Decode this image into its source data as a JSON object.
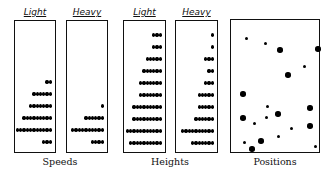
{
  "groups": [
    {
      "label": "Speeds",
      "panels": [
        {
          "title": "Light",
          "rows": [
            2,
            6,
            7,
            9,
            11,
            3
          ]
        },
        {
          "title": "Heavy",
          "rows": [
            0,
            0,
            1,
            6,
            10,
            4
          ]
        }
      ]
    },
    {
      "label": "Heights",
      "panels": [
        {
          "title": "Light",
          "rows": [
            3,
            3,
            5,
            6,
            7,
            7,
            9,
            9,
            11,
            10
          ]
        },
        {
          "title": "Heavy",
          "rows": [
            1,
            1,
            3,
            2,
            3,
            5,
            5,
            6,
            10,
            7
          ]
        }
      ]
    },
    {
      "label": "Positions"
    }
  ],
  "positions": {
    "particles": [
      {
        "x": 15,
        "y": 18,
        "size": "small"
      },
      {
        "x": 34,
        "y": 23,
        "size": "small"
      },
      {
        "x": 49,
        "y": 30,
        "size": "large"
      },
      {
        "x": 87,
        "y": 29,
        "size": "large"
      },
      {
        "x": 73,
        "y": 46,
        "size": "small"
      },
      {
        "x": 57,
        "y": 55,
        "size": "large"
      },
      {
        "x": 12,
        "y": 74,
        "size": "large"
      },
      {
        "x": 36,
        "y": 86,
        "size": "small"
      },
      {
        "x": 79,
        "y": 88,
        "size": "large"
      },
      {
        "x": 47,
        "y": 94,
        "size": "large"
      },
      {
        "x": 35,
        "y": 97,
        "size": "small"
      },
      {
        "x": 12,
        "y": 98,
        "size": "large"
      },
      {
        "x": 23,
        "y": 103,
        "size": "small"
      },
      {
        "x": 79,
        "y": 106,
        "size": "large"
      },
      {
        "x": 60,
        "y": 108,
        "size": "small"
      },
      {
        "x": 47,
        "y": 116,
        "size": "small"
      },
      {
        "x": 30,
        "y": 121,
        "size": "large"
      },
      {
        "x": 13,
        "y": 122,
        "size": "small"
      },
      {
        "x": 84,
        "y": 126,
        "size": "small"
      },
      {
        "x": 21,
        "y": 129,
        "size": "large"
      }
    ]
  }
}
